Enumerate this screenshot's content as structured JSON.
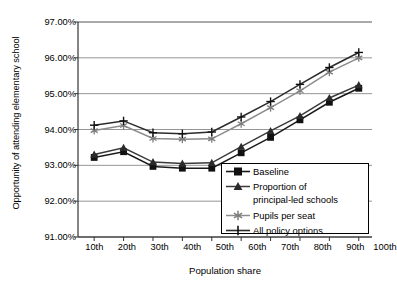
{
  "chart_data": {
    "type": "line",
    "title": "",
    "xlabel": "Population share",
    "ylabel": "Opportunity of attending elementary school",
    "categories": [
      "10th",
      "20th",
      "30th",
      "40th",
      "50th",
      "60th",
      "70th",
      "80th",
      "90th",
      "100th"
    ],
    "ylim": [
      91.0,
      97.0
    ],
    "ytick_values": [
      91.0,
      92.0,
      93.0,
      94.0,
      95.0,
      96.0,
      97.0
    ],
    "ytick_labels": [
      "91.00%",
      "92.00%",
      "93.00%",
      "94.00%",
      "95.00%",
      "96.00%",
      "97.00%"
    ],
    "grid": "horizontal",
    "legend_position": "inside-bottom-right",
    "series": [
      {
        "name": "Baseline",
        "marker": "filled-square",
        "color": "#1a1a1a",
        "values": [
          93.22,
          93.38,
          92.97,
          92.92,
          92.92,
          93.35,
          93.78,
          94.27,
          94.76,
          95.15
        ]
      },
      {
        "name": "Proportion of principal-led schools",
        "marker": "filled-triangle",
        "color": "#3a3a3a",
        "values": [
          93.3,
          93.49,
          93.09,
          93.05,
          93.07,
          93.52,
          93.96,
          94.38,
          94.88,
          95.24
        ]
      },
      {
        "name": "Pupils per seat",
        "marker": "asterisk",
        "color": "#8c8c8c",
        "values": [
          93.97,
          94.11,
          93.75,
          93.73,
          93.74,
          94.16,
          94.61,
          95.08,
          95.6,
          96.0
        ]
      },
      {
        "name": "All policy options",
        "marker": "plus",
        "color": "#2b2b2b",
        "values": [
          94.12,
          94.24,
          93.91,
          93.88,
          93.93,
          94.35,
          94.78,
          95.26,
          95.73,
          96.15
        ]
      }
    ]
  },
  "legend": {
    "entries": [
      {
        "label": "Baseline",
        "label_cont": ""
      },
      {
        "label": "Proportion of",
        "label_cont": "principal-led schools"
      },
      {
        "label": "Pupils per seat",
        "label_cont": ""
      },
      {
        "label": "All policy options",
        "label_cont": ""
      }
    ]
  }
}
